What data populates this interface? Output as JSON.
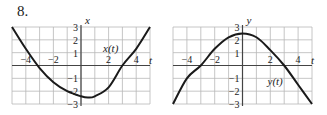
{
  "problem_number": "8.",
  "chart_data": [
    {
      "type": "line",
      "title": "",
      "function_label": "x(t)",
      "xlabel": "t",
      "ylabel": "x",
      "xlim": [
        -5,
        5
      ],
      "ylim": [
        -3,
        3
      ],
      "xticks": [
        -4,
        -2,
        2,
        4
      ],
      "yticks": [
        3,
        2,
        1,
        -1,
        -2,
        -3
      ],
      "grid": true,
      "series": [
        {
          "name": "x(t)",
          "x": [
            -5,
            -4,
            -3,
            -2,
            -1,
            0,
            0.5,
            1,
            2,
            3,
            4,
            5
          ],
          "values": [
            3.0,
            1.3,
            -0.2,
            -1.3,
            -2.0,
            -2.4,
            -2.5,
            -2.4,
            -1.7,
            0.0,
            1.3,
            3.0
          ]
        }
      ]
    },
    {
      "type": "line",
      "title": "",
      "function_label": "y(t)",
      "xlabel": "t",
      "ylabel": "y",
      "xlim": [
        -5,
        5
      ],
      "ylim": [
        -3,
        3
      ],
      "xticks": [
        -4,
        -2,
        2,
        4
      ],
      "yticks": [
        3,
        2,
        1,
        -1,
        -2,
        -3
      ],
      "grid": true,
      "series": [
        {
          "name": "y(t)",
          "x": [
            -5,
            -4,
            -3,
            -2,
            -1,
            0,
            1,
            2,
            3,
            4,
            5
          ],
          "values": [
            -3.0,
            -1.0,
            0.0,
            1.3,
            2.2,
            2.5,
            2.2,
            1.2,
            0.0,
            -1.5,
            -3.0
          ]
        }
      ]
    }
  ]
}
